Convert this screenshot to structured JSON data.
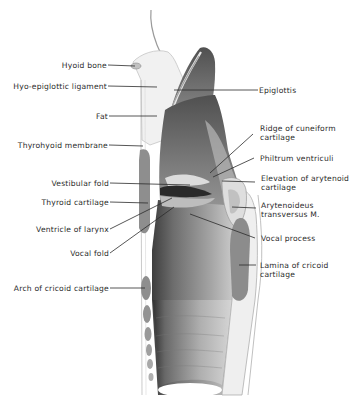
{
  "figure": {
    "colors": {
      "background": "#ffffff",
      "mucosa_dark": "#5d5d5d",
      "mucosa_mid": "#8f8f8f",
      "mucosa_light": "#c9c9c9",
      "cartilage": "#8a8a8a",
      "tissue_light": "#eeeeee",
      "leader_line": "#2b2b2b",
      "text": "#2b2b2b"
    }
  },
  "labels_left": [
    {
      "id": "hyoid-bone",
      "text": "Hyoid bone"
    },
    {
      "id": "hyo-epiglottic-ligament",
      "text": "Hyo-epiglottic ligament"
    },
    {
      "id": "fat",
      "text": "Fat"
    },
    {
      "id": "thyrohyoid-membrane",
      "text": "Thyrohyoid membrane"
    },
    {
      "id": "vestibular-fold",
      "text": "Vestibular fold"
    },
    {
      "id": "thyroid-cartilage",
      "text": "Thyroid cartilage"
    },
    {
      "id": "ventricle-of-larynx",
      "text": "Ventricle of larynx"
    },
    {
      "id": "vocal-fold",
      "text": "Vocal fold"
    },
    {
      "id": "arch-of-cricoid-cartilage",
      "text": "Arch of cricoid cartilage"
    }
  ],
  "labels_right": [
    {
      "id": "epiglottis",
      "text": "Epiglottis"
    },
    {
      "id": "ridge-of-cuneiform-cartilage",
      "line1": "Ridge of cuneiform",
      "line2": "cartilage"
    },
    {
      "id": "philtrum-ventriculi",
      "text": "Philtrum ventriculi"
    },
    {
      "id": "elevation-of-arytenoid-cartilage",
      "line1": "Elevation of arytenoid",
      "line2": "cartilage"
    },
    {
      "id": "arytenoideus-transversus",
      "line1": "Arytenoideus",
      "line2": "transversus M."
    },
    {
      "id": "vocal-process",
      "text": "Vocal process"
    },
    {
      "id": "lamina-of-cricoid-cartilage",
      "line1": "Lamina of cricoid",
      "line2": "cartilage"
    }
  ]
}
